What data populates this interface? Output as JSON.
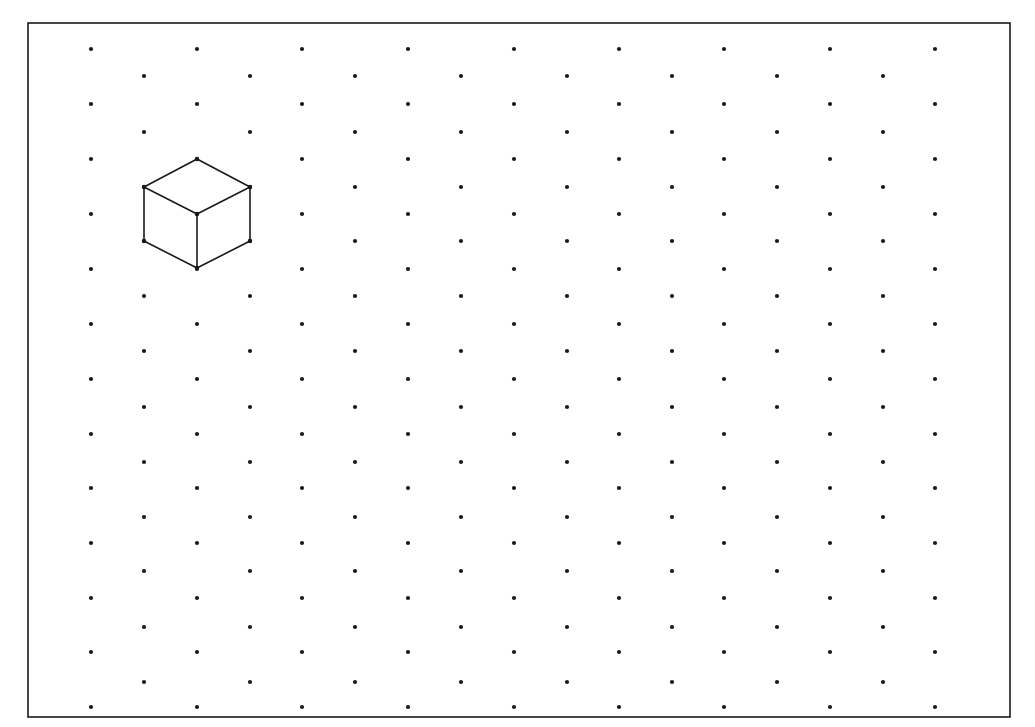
{
  "page": {
    "background": "#ffffff",
    "ink_color": "#1a1a1a"
  },
  "frame": {
    "left": 28,
    "top": 23,
    "right": 1010,
    "bottom": 717,
    "stroke_width": 1.6,
    "color": "#1a1a1a"
  },
  "isometric_grid": {
    "dot_radius": 2.1,
    "dot_color": "#1a1a1a",
    "even_columns_x": [
      91,
      197,
      302,
      408,
      514,
      619,
      724,
      830,
      935
    ],
    "odd_columns_x": [
      144,
      250,
      355,
      461,
      567,
      672,
      777,
      883
    ],
    "even_rows_y": [
      49,
      104,
      159,
      214,
      269,
      324,
      379,
      434,
      488,
      543,
      598,
      652,
      707
    ],
    "odd_rows_y": [
      76,
      132,
      187,
      241,
      296,
      351,
      407,
      462,
      517,
      571,
      627,
      682
    ]
  },
  "cube": {
    "stroke_color": "#1a1a1a",
    "stroke_width": 1.6,
    "vertices": {
      "top": [
        197,
        159
      ],
      "upper_left": [
        144,
        187
      ],
      "upper_right": [
        250,
        187
      ],
      "center": [
        197,
        214
      ],
      "lower_left": [
        144,
        241
      ],
      "lower_right": [
        250,
        241
      ],
      "bottom": [
        197,
        268
      ]
    },
    "edges": [
      [
        "top",
        "upper_left"
      ],
      [
        "top",
        "upper_right"
      ],
      [
        "upper_left",
        "center"
      ],
      [
        "upper_right",
        "center"
      ],
      [
        "upper_left",
        "lower_left"
      ],
      [
        "upper_right",
        "lower_right"
      ],
      [
        "center",
        "bottom"
      ],
      [
        "lower_left",
        "bottom"
      ],
      [
        "lower_right",
        "bottom"
      ]
    ]
  }
}
